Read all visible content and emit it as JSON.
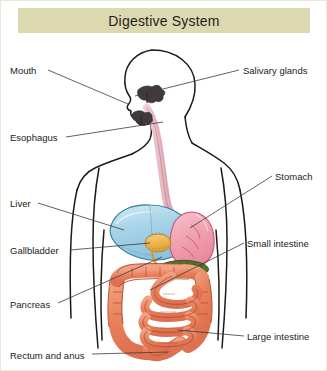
{
  "title": "Digestive System",
  "banner": {
    "background_color": "#dcd9b0",
    "text_color": "#1d1d1b"
  },
  "diagram": {
    "type": "anatomical-illustration",
    "view": "anterior body outline with left-facing head profile",
    "background_color": "#ffffff",
    "outline_color": "#1a1a1a",
    "leader_line_color": "#3a3a3a"
  },
  "labels": [
    {
      "id": "mouth",
      "text": "Mouth",
      "side": "left",
      "x": 10,
      "y": 66,
      "line": [
        48,
        70,
        128,
        104
      ]
    },
    {
      "id": "esophagus",
      "text": "Esophagus",
      "side": "left",
      "x": 10,
      "y": 133,
      "line": [
        66,
        137,
        163,
        122
      ]
    },
    {
      "id": "liver",
      "text": "Liver",
      "side": "left",
      "x": 10,
      "y": 199,
      "line": [
        38,
        203,
        124,
        230
      ]
    },
    {
      "id": "gallbladder",
      "text": "Gallbladder",
      "side": "left",
      "x": 10,
      "y": 246,
      "line": [
        70,
        250,
        150,
        243
      ]
    },
    {
      "id": "pancreas",
      "text": "Pancreas",
      "side": "left",
      "x": 10,
      "y": 300,
      "line": [
        58,
        303,
        162,
        257
      ]
    },
    {
      "id": "rectum-and-anus",
      "text": "Rectum and anus",
      "side": "left",
      "x": 10,
      "y": 351,
      "line": [
        92,
        354,
        168,
        352
      ]
    },
    {
      "id": "salivary-glands",
      "text": "Salivary glands",
      "side": "right",
      "x": 243,
      "y": 66,
      "line": [
        239,
        70,
        135,
        96
      ]
    },
    {
      "id": "stomach",
      "text": "Stomach",
      "side": "right",
      "x": 275,
      "y": 172,
      "line": [
        272,
        176,
        190,
        228
      ]
    },
    {
      "id": "small-intestine",
      "text": "Small intestine",
      "side": "right",
      "x": 247,
      "y": 239,
      "line": [
        244,
        243,
        150,
        290
      ]
    },
    {
      "id": "large-intestine",
      "text": "Large intestine",
      "side": "right",
      "x": 247,
      "y": 332,
      "line": [
        244,
        336,
        178,
        330
      ]
    }
  ],
  "organs": [
    {
      "id": "salivary-glands",
      "name": "Salivary glands",
      "color": "#403a3c"
    },
    {
      "id": "esophagus",
      "name": "Esophagus",
      "color": "#e7b6c0"
    },
    {
      "id": "stomach",
      "name": "Stomach",
      "color": "#f0a0b0"
    },
    {
      "id": "liver",
      "name": "Liver",
      "color": "#a8d4e8"
    },
    {
      "id": "gallbladder",
      "name": "Gallbladder",
      "color": "#edb44e"
    },
    {
      "id": "pancreas",
      "name": "Pancreas",
      "color": "#53702e"
    },
    {
      "id": "small-intestine",
      "name": "Small intestine",
      "color": "#e8805a"
    },
    {
      "id": "large-intestine",
      "name": "Large intestine",
      "color": "#e8805a"
    },
    {
      "id": "rectum-and-anus",
      "name": "Rectum and anus",
      "color": "#e8805a"
    }
  ]
}
